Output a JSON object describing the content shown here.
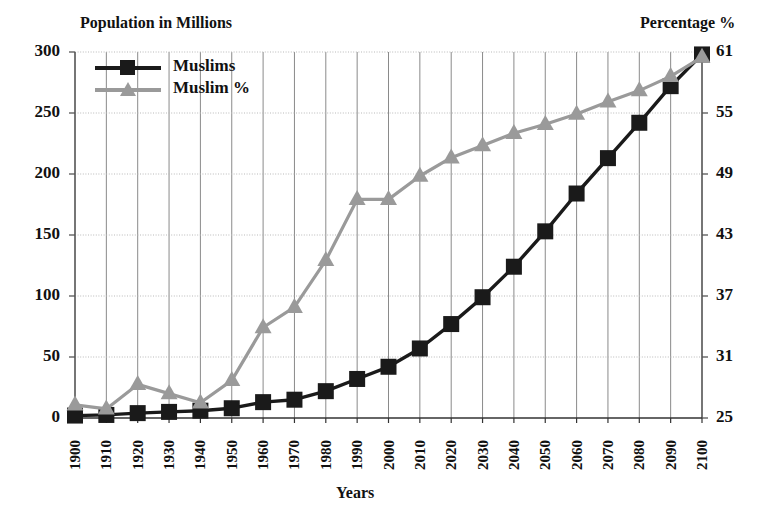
{
  "chart_data": {
    "type": "line",
    "title": "",
    "xlabel": "Years",
    "ylabel_left": "Population in Millions",
    "ylabel_right": "Percentage %",
    "grid": true,
    "legend_position": "top-left",
    "categories": [
      "1900",
      "1910",
      "1920",
      "1930",
      "1940",
      "1950",
      "1960",
      "1970",
      "1980",
      "1990",
      "2000",
      "2010",
      "2020",
      "2030",
      "2040",
      "2050",
      "2060",
      "2070",
      "2080",
      "2090",
      "2100"
    ],
    "left_axis": {
      "label": "Population in Millions",
      "ticks": [
        0,
        50,
        100,
        150,
        200,
        250,
        300
      ],
      "ylim": [
        0,
        300
      ]
    },
    "right_axis": {
      "label": "Percentage %",
      "ticks": [
        25,
        31,
        37,
        43,
        49,
        55,
        61
      ],
      "ylim": [
        25,
        61
      ]
    },
    "series": [
      {
        "name": "Muslims",
        "axis": "left",
        "color": "#1a1a1a",
        "marker": "square",
        "values": [
          2,
          2.5,
          4,
          5,
          6,
          8,
          13,
          15,
          22,
          32,
          42,
          57,
          77,
          99,
          124,
          153,
          184,
          213,
          242,
          272,
          298
        ]
      },
      {
        "name": "Muslim %",
        "axis": "right",
        "color": "#9a9a9a",
        "marker": "triangle",
        "values": [
          26.3,
          25.9,
          28.3,
          27.4,
          26.5,
          28.7,
          33.9,
          35.9,
          40.5,
          46.5,
          46.5,
          48.8,
          50.6,
          51.8,
          53.0,
          53.9,
          54.9,
          56.1,
          57.2,
          58.6,
          60.5
        ]
      }
    ],
    "legend": [
      {
        "label": "Muslims",
        "color": "#1a1a1a",
        "marker": "square"
      },
      {
        "label": "Muslim %",
        "color": "#9a9a9a",
        "marker": "triangle"
      }
    ]
  },
  "axes": {
    "left_title": "Population in Millions",
    "right_title": "Percentage %",
    "bottom_title": "Years"
  }
}
